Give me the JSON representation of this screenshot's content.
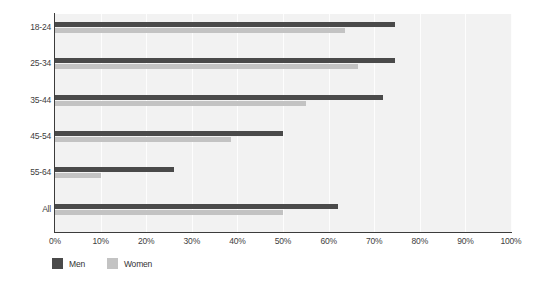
{
  "chart_data": {
    "type": "bar",
    "orientation": "horizontal",
    "title": "",
    "xlabel": "",
    "ylabel": "",
    "categories": [
      "18-24",
      "25-34",
      "35-44",
      "45-54",
      "55-64",
      "All"
    ],
    "series": [
      {
        "name": "Men",
        "color": "#4a4a4a",
        "values": [
          74.5,
          74.5,
          72,
          50,
          26,
          62
        ]
      },
      {
        "name": "Women",
        "color": "#c3c3c3",
        "values": [
          63.5,
          66.5,
          55,
          38.5,
          10,
          50
        ]
      }
    ],
    "xlim": [
      0,
      100
    ],
    "xticks": [
      0,
      10,
      20,
      30,
      40,
      50,
      60,
      70,
      80,
      90,
      100
    ],
    "xtick_labels": [
      "0%",
      "10%",
      "20%",
      "30%",
      "40%",
      "50%",
      "60%",
      "70%",
      "80%",
      "90%",
      "100%"
    ],
    "grid": true,
    "grid_axis": "x",
    "legend_position": "bottom-left",
    "plot_background": "#f2f2f2",
    "axis_color": "#3c3c3c",
    "tick_label_color": "#404040"
  }
}
